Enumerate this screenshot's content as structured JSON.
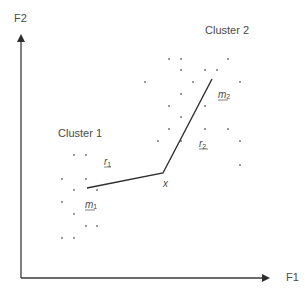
{
  "axes": {
    "x_label": "F1",
    "y_label": "F2"
  },
  "clusters": [
    {
      "label": "Cluster 1",
      "mean_label": "m",
      "mean_sub": "1",
      "points": [
        [
          74,
          155
        ],
        [
          86,
          155
        ],
        [
          62,
          179
        ],
        [
          86,
          179
        ],
        [
          74,
          190
        ],
        [
          97,
          190
        ],
        [
          62,
          202
        ],
        [
          74,
          214
        ],
        [
          86,
          226
        ],
        [
          97,
          226
        ],
        [
          62,
          238
        ],
        [
          74,
          238
        ]
      ]
    },
    {
      "label": "Cluster 2",
      "mean_label": "m",
      "mean_sub": "2",
      "points": [
        [
          145,
          82
        ],
        [
          169,
          59
        ],
        [
          181,
          59
        ],
        [
          228,
          59
        ],
        [
          181,
          70
        ],
        [
          205,
          70
        ],
        [
          217,
          70
        ],
        [
          193,
          82
        ],
        [
          240,
          82
        ],
        [
          181,
          94
        ],
        [
          169,
          106
        ],
        [
          205,
          106
        ],
        [
          181,
          117
        ],
        [
          169,
          129
        ],
        [
          205,
          129
        ],
        [
          228,
          129
        ],
        [
          158,
          141
        ],
        [
          181,
          141
        ],
        [
          240,
          141
        ],
        [
          240,
          165
        ]
      ]
    }
  ],
  "sample_point": {
    "label": "x"
  },
  "distances": [
    {
      "label": "r",
      "sub": "1"
    },
    {
      "label": "r",
      "sub": "2"
    }
  ],
  "colors": {
    "axis": "#3a3a3a",
    "line": "#2e2e2e",
    "dot": "#6a6a6a",
    "text": "#4a4a4a"
  }
}
